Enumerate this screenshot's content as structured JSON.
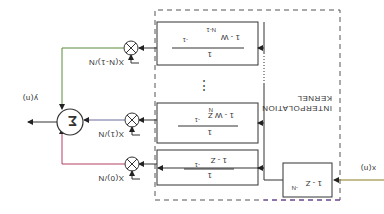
{
  "diagram": {
    "orientation_deg": 180,
    "kernel": {
      "label_line1": "INTERPOLATION",
      "label_line2": "KERNEL"
    },
    "input": {
      "label": "x(n)"
    },
    "delay_block": {
      "numerator": "1 - Z",
      "exponent": "-N"
    },
    "filters": [
      {
        "numerator": "1",
        "denominator": "1 - Z",
        "denominator_exp": "-1",
        "note": "bottom branch"
      },
      {
        "numerator": "1",
        "denominator": "1 - W Z",
        "w_exp": "N",
        "z_exp": "-1",
        "note": "middle branch"
      },
      {
        "numerator": "1",
        "denominator": "1 - W",
        "w_exp": "N-1",
        "z_exp": "-1",
        "note": "top branch"
      }
    ],
    "ellipsis": "⋮",
    "multipliers": [
      {
        "coef": "X(0)/N"
      },
      {
        "coef": "X(1)/N"
      },
      {
        "coef": "X(N-1)/N"
      }
    ],
    "summer": {
      "symbol": "Σ"
    },
    "output": {
      "label": "y(n)"
    },
    "colors": {
      "line": "#333333",
      "dashed_box": "#555555",
      "accent_dash": "#7b3fb0"
    }
  }
}
